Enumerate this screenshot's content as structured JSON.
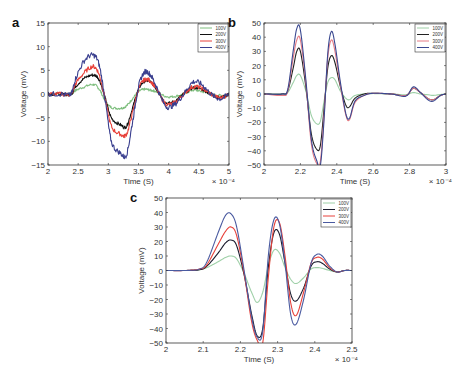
{
  "chart_data": [
    {
      "id": "a",
      "type": "line",
      "panel_label": "a",
      "xlabel": "Time (S)",
      "ylabel": "Voltage (mV)",
      "x_multiplier": "× 10⁻⁴",
      "xlim": [
        2,
        5
      ],
      "ylim": [
        -15,
        15
      ],
      "xticks": [
        2,
        2.5,
        3,
        3.5,
        4,
        4.5,
        5
      ],
      "yticks": [
        -15,
        -10,
        -5,
        0,
        5,
        10,
        15
      ],
      "legend_position": "upper right",
      "box": {
        "left": 48,
        "top": 23,
        "right": 229,
        "bottom": 165
      },
      "noisy": true,
      "series": [
        {
          "name": "100V",
          "color": "#7fbf7f",
          "x": [
            2,
            2.2,
            2.38,
            2.45,
            2.6,
            2.75,
            2.85,
            2.95,
            3.05,
            3.2,
            3.3,
            3.4,
            3.5,
            3.6,
            3.7,
            3.8,
            3.95,
            4.1,
            4.25,
            4.4,
            4.55,
            4.7,
            4.85,
            5
          ],
          "y": [
            0,
            0,
            0,
            0.7,
            1.5,
            2,
            1,
            -1.5,
            -2.8,
            -3,
            -2.5,
            -1,
            0.5,
            1,
            0.8,
            0.5,
            -0.5,
            -0.5,
            0,
            0.8,
            0.5,
            0,
            -0.3,
            0
          ]
        },
        {
          "name": "200V",
          "color": "#111111",
          "x": [
            2,
            2.2,
            2.38,
            2.45,
            2.6,
            2.75,
            2.85,
            2.95,
            3.05,
            3.2,
            3.3,
            3.4,
            3.5,
            3.6,
            3.7,
            3.8,
            3.95,
            4.1,
            4.25,
            4.4,
            4.55,
            4.7,
            4.85,
            5
          ],
          "y": [
            0,
            0,
            0,
            1.5,
            3.3,
            4,
            3,
            -1,
            -5,
            -6.5,
            -6.8,
            -3,
            1,
            2.7,
            2.5,
            1,
            -1.8,
            -1.5,
            0,
            1.3,
            1,
            0,
            -0.8,
            0
          ]
        },
        {
          "name": "300V",
          "color": "#e8413a",
          "x": [
            2,
            2.2,
            2.38,
            2.45,
            2.6,
            2.75,
            2.85,
            2.95,
            3.05,
            3.2,
            3.3,
            3.4,
            3.5,
            3.6,
            3.7,
            3.8,
            3.95,
            4.1,
            4.25,
            4.4,
            4.55,
            4.7,
            4.85,
            5
          ],
          "y": [
            0,
            0,
            0,
            2,
            4.5,
            5.8,
            4,
            -1.2,
            -6.8,
            -8.5,
            -8.5,
            -4,
            1,
            3,
            2.7,
            1,
            -2,
            -1.8,
            0,
            1.5,
            1.2,
            0,
            -0.8,
            0
          ]
        },
        {
          "name": "400V",
          "color": "#3a3f8f",
          "x": [
            2,
            2.2,
            2.38,
            2.45,
            2.6,
            2.75,
            2.85,
            2.95,
            3.05,
            3.2,
            3.3,
            3.4,
            3.5,
            3.6,
            3.7,
            3.8,
            3.95,
            4.1,
            4.25,
            4.4,
            4.55,
            4.7,
            4.85,
            5
          ],
          "y": [
            0,
            0,
            0,
            3,
            7,
            8.2,
            6,
            -1.5,
            -10,
            -12.5,
            -12.8,
            -6,
            1.5,
            4.6,
            4,
            1.5,
            -2.5,
            -2.2,
            0,
            2.5,
            2,
            0,
            -1,
            0
          ]
        }
      ]
    },
    {
      "id": "b",
      "type": "line",
      "panel_label": "b",
      "xlabel": "Time (S)",
      "ylabel": "Voltage (mV)",
      "x_multiplier": "× 10⁻⁴",
      "xlim": [
        2,
        3
      ],
      "ylim": [
        -50,
        50
      ],
      "xticks": [
        2,
        2.2,
        2.4,
        2.6,
        2.8,
        3
      ],
      "yticks": [
        -50,
        -40,
        -30,
        -20,
        -10,
        0,
        10,
        20,
        30,
        40,
        50
      ],
      "legend_position": "upper right",
      "box": {
        "left": 264,
        "top": 23,
        "right": 446,
        "bottom": 165
      },
      "noisy": false,
      "series": [
        {
          "name": "100V",
          "color": "#9fd0a8",
          "x": [
            2,
            2.1,
            2.13,
            2.16,
            2.18,
            2.2,
            2.23,
            2.26,
            2.29,
            2.31,
            2.33,
            2.35,
            2.37,
            2.39,
            2.42,
            2.45,
            2.47,
            2.5,
            2.55,
            2.6,
            2.7,
            2.78,
            2.82,
            2.86,
            2.9,
            2.93,
            2.97,
            3
          ],
          "y": [
            0,
            0,
            1,
            8,
            13,
            13,
            2,
            -15,
            -21,
            -19,
            -5,
            8,
            11.5,
            10,
            2,
            -3,
            -4,
            -1,
            0,
            0.3,
            0,
            -0.5,
            1,
            0,
            -0.5,
            -1,
            -0.3,
            0
          ]
        },
        {
          "name": "200V",
          "color": "#222222",
          "x": [
            2,
            2.1,
            2.13,
            2.16,
            2.18,
            2.2,
            2.23,
            2.26,
            2.29,
            2.31,
            2.33,
            2.35,
            2.37,
            2.39,
            2.42,
            2.45,
            2.47,
            2.5,
            2.55,
            2.6,
            2.7,
            2.78,
            2.82,
            2.86,
            2.9,
            2.93,
            2.97,
            3
          ],
          "y": [
            0,
            0,
            2,
            18,
            30,
            30,
            5,
            -28,
            -39,
            -36,
            -10,
            18,
            27,
            22,
            5,
            -8,
            -9,
            -3,
            0,
            0.5,
            0,
            -1,
            4,
            1,
            -3,
            -4,
            -1,
            0
          ]
        },
        {
          "name": "300V",
          "color": "#e57b84",
          "x": [
            2,
            2.1,
            2.13,
            2.16,
            2.18,
            2.2,
            2.23,
            2.26,
            2.29,
            2.31,
            2.33,
            2.35,
            2.37,
            2.39,
            2.42,
            2.45,
            2.47,
            2.5,
            2.55,
            2.6,
            2.7,
            2.78,
            2.82,
            2.86,
            2.9,
            2.93,
            2.97,
            3
          ],
          "y": [
            0,
            -1,
            2,
            25,
            38,
            38,
            8,
            -35,
            -49,
            -47,
            -15,
            25,
            38,
            30,
            6,
            -15,
            -18,
            -6,
            -1,
            0.5,
            0,
            -1,
            4,
            1,
            -3,
            -4,
            -1,
            0
          ]
        },
        {
          "name": "400V",
          "color": "#3a4890",
          "x": [
            2,
            2.1,
            2.13,
            2.16,
            2.18,
            2.2,
            2.23,
            2.26,
            2.29,
            2.31,
            2.33,
            2.35,
            2.37,
            2.39,
            2.42,
            2.45,
            2.47,
            2.5,
            2.55,
            2.6,
            2.7,
            2.78,
            2.82,
            2.86,
            2.9,
            2.93,
            2.97,
            3
          ],
          "y": [
            0,
            0,
            3,
            30,
            46,
            45,
            10,
            -32,
            -47,
            -50,
            -18,
            28,
            44,
            35,
            8,
            -14,
            -17,
            -5,
            -1,
            0.5,
            0,
            -1.5,
            5,
            1,
            -4,
            -5,
            -1,
            0
          ]
        }
      ]
    },
    {
      "id": "c",
      "type": "line",
      "panel_label": "c",
      "xlabel": "Time (S)",
      "ylabel": "Voltage (mV)",
      "x_multiplier": "× 10⁻⁴",
      "xlim": [
        2,
        2.5
      ],
      "ylim": [
        -50,
        50
      ],
      "xticks": [
        2,
        2.1,
        2.2,
        2.3,
        2.4,
        2.5
      ],
      "yticks": [
        -50,
        -40,
        -30,
        -20,
        -10,
        0,
        10,
        20,
        30,
        40,
        50
      ],
      "legend_position": "upper right",
      "box": {
        "left": 166,
        "top": 198,
        "right": 352,
        "bottom": 343
      },
      "noisy": false,
      "series": [
        {
          "name": "100V",
          "color": "#9fd0a8",
          "x": [
            2,
            2.05,
            2.09,
            2.11,
            2.14,
            2.16,
            2.175,
            2.19,
            2.21,
            2.23,
            2.245,
            2.26,
            2.275,
            2.29,
            2.305,
            2.32,
            2.335,
            2.35,
            2.37,
            2.39,
            2.405,
            2.42,
            2.44,
            2.46,
            2.48,
            2.5
          ],
          "y": [
            0,
            0,
            0.5,
            2,
            6,
            9,
            10,
            8,
            -2,
            -15,
            -22,
            -15,
            3,
            14,
            12,
            2,
            -6,
            -9,
            -5,
            1,
            2,
            1.5,
            0,
            -1,
            0,
            0
          ]
        },
        {
          "name": "200V",
          "color": "#1b1b2e",
          "x": [
            2,
            2.05,
            2.09,
            2.11,
            2.14,
            2.16,
            2.175,
            2.19,
            2.21,
            2.23,
            2.245,
            2.26,
            2.275,
            2.29,
            2.305,
            2.32,
            2.335,
            2.35,
            2.37,
            2.39,
            2.405,
            2.42,
            2.44,
            2.46,
            2.48,
            2.5
          ],
          "y": [
            0,
            0,
            0.5,
            3,
            12,
            19,
            21,
            17,
            -3,
            -30,
            -45,
            -40,
            2,
            26,
            25,
            5,
            -16,
            -21,
            -12,
            3,
            6,
            5,
            1,
            -1,
            0,
            0
          ]
        },
        {
          "name": "300V",
          "color": "#e8413a",
          "x": [
            2,
            2.05,
            2.09,
            2.11,
            2.14,
            2.16,
            2.175,
            2.19,
            2.21,
            2.23,
            2.245,
            2.26,
            2.275,
            2.29,
            2.305,
            2.32,
            2.335,
            2.35,
            2.37,
            2.39,
            2.405,
            2.42,
            2.44,
            2.46,
            2.48,
            2.5
          ],
          "y": [
            0,
            0,
            1,
            4,
            18,
            27,
            30,
            24,
            -2,
            -35,
            -48,
            -50,
            -5,
            30,
            33,
            10,
            -22,
            -31,
            -15,
            5,
            9,
            8,
            2,
            -1,
            0,
            0
          ]
        },
        {
          "name": "400V",
          "color": "#4a5aa0",
          "x": [
            2,
            2.05,
            2.09,
            2.11,
            2.14,
            2.16,
            2.175,
            2.19,
            2.21,
            2.23,
            2.245,
            2.26,
            2.275,
            2.29,
            2.305,
            2.32,
            2.335,
            2.35,
            2.37,
            2.39,
            2.405,
            2.42,
            2.44,
            2.46,
            2.48,
            2.5
          ],
          "y": [
            0,
            0,
            1,
            6,
            26,
            38,
            39,
            30,
            0,
            -32,
            -46,
            -42,
            10,
            35,
            32,
            5,
            -30,
            -37,
            -20,
            5,
            11,
            10,
            3,
            -1,
            0,
            0
          ]
        }
      ]
    }
  ]
}
